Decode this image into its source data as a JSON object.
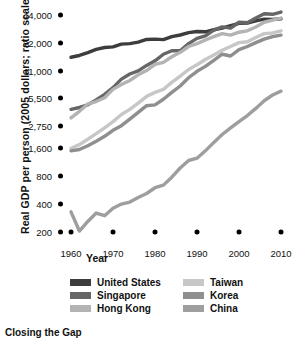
{
  "figure": {
    "caption": "Closing the Gap",
    "xaxis_title": "Year"
  },
  "chart_data": {
    "type": "line",
    "title": "Closing the Gap",
    "xlabel": "Year",
    "ylabel": "Real GDP per person (2005 dollars; ratio scale)",
    "yscale": "log",
    "ylim": [
      200,
      52000
    ],
    "xlim": [
      1960,
      2010
    ],
    "grid": false,
    "legend_position": "below-axes",
    "ytick_labels": [
      "44,000",
      "22,000",
      "11,000",
      "5,500",
      "2,750",
      "1,600",
      "800",
      "400",
      "200"
    ],
    "ytick_values": [
      44000,
      22000,
      11000,
      5500,
      2750,
      1600,
      800,
      400,
      200
    ],
    "xtick_labels": [
      "1960",
      "1970",
      "1980",
      "1990",
      "2000",
      "2010"
    ],
    "xtick_values": [
      1960,
      1970,
      1980,
      1990,
      2000,
      2010
    ],
    "x": [
      1960,
      1962,
      1964,
      1966,
      1968,
      1970,
      1972,
      1974,
      1976,
      1978,
      1980,
      1982,
      1984,
      1986,
      1988,
      1990,
      1992,
      1994,
      1996,
      1998,
      2000,
      2002,
      2004,
      2006,
      2008,
      2010
    ],
    "series": [
      {
        "name": "United States",
        "color": "#3d3d3d",
        "values": [
          15300,
          16000,
          17200,
          18600,
          19500,
          19800,
          21200,
          21500,
          22300,
          23800,
          24000,
          23700,
          25600,
          26600,
          28200,
          29000,
          28800,
          30300,
          31600,
          33600,
          35500,
          35800,
          37700,
          39500,
          39200,
          39800
        ]
      },
      {
        "name": "Singapore",
        "color": "#666666",
        "values": [
          4200,
          4400,
          4700,
          5300,
          6100,
          7200,
          8900,
          10100,
          10900,
          12500,
          14000,
          16500,
          18000,
          18000,
          21500,
          24500,
          26000,
          30000,
          32500,
          31500,
          36500,
          36000,
          40500,
          45000,
          44500,
          47000
        ]
      },
      {
        "name": "Hong Kong",
        "color": "#b3b3b3",
        "values": [
          3400,
          4000,
          4800,
          5100,
          5600,
          6900,
          7800,
          8600,
          9900,
          11000,
          12800,
          13500,
          15500,
          17300,
          20000,
          21500,
          23500,
          25500,
          27500,
          26500,
          28500,
          29500,
          32500,
          36500,
          38500,
          40500
        ]
      },
      {
        "name": "Taiwan",
        "color": "#c7c7c7",
        "values": [
          1600,
          1750,
          2000,
          2300,
          2650,
          3100,
          3700,
          4200,
          4900,
          5800,
          6400,
          6900,
          8200,
          9600,
          11300,
          12700,
          14500,
          16200,
          18200,
          20000,
          22000,
          22500,
          25000,
          27500,
          28000,
          29500
        ]
      },
      {
        "name": "Korea",
        "color": "#8f8f8f",
        "values": [
          1500,
          1550,
          1700,
          1900,
          2150,
          2500,
          2800,
          3300,
          3900,
          4600,
          4700,
          5400,
          6400,
          7500,
          9200,
          10800,
          12200,
          14200,
          16500,
          15800,
          18500,
          20000,
          22000,
          24000,
          25500,
          26500
        ]
      },
      {
        "name": "China",
        "color": "#9e9e9e",
        "values": [
          330,
          205,
          260,
          320,
          300,
          360,
          400,
          420,
          470,
          520,
          600,
          640,
          780,
          980,
          1180,
          1250,
          1500,
          1850,
          2250,
          2650,
          3100,
          3600,
          4300,
          5200,
          6000,
          6600
        ]
      }
    ]
  },
  "legend": {
    "entries": [
      {
        "label": "United States",
        "color": "#3d3d3d"
      },
      {
        "label": "Taiwan",
        "color": "#c7c7c7"
      },
      {
        "label": "Singapore",
        "color": "#666666"
      },
      {
        "label": "Korea",
        "color": "#8f8f8f"
      },
      {
        "label": "Hong Kong",
        "color": "#b3b3b3"
      },
      {
        "label": "China",
        "color": "#9e9e9e"
      }
    ]
  }
}
